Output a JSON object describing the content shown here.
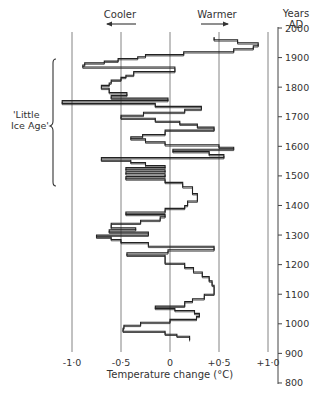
{
  "chart_data": {
    "type": "line",
    "style": "step",
    "title": "",
    "xlabel": "Temperature change (°C)",
    "ylabel": "Years AD",
    "xlim": [
      -1.0,
      1.0
    ],
    "ylim": [
      800,
      2000
    ],
    "x_ticks": [
      "-1·0",
      "-0·5",
      "0",
      "+0·5",
      "+1·0"
    ],
    "x_tick_values": [
      -1.0,
      -0.5,
      0,
      0.5,
      1.0
    ],
    "y_ticks": [
      "2000",
      "1900",
      "1800",
      "1700",
      "1600",
      "1500",
      "1400",
      "1300",
      "1200",
      "1100",
      "1000",
      "900",
      "800"
    ],
    "y_tick_values": [
      2000,
      1900,
      1800,
      1700,
      1600,
      1500,
      1400,
      1300,
      1200,
      1100,
      1000,
      900,
      800
    ],
    "grid": "vertical lines at each temperature tick",
    "annotations": {
      "cooler": "Cooler",
      "warmer": "Warmer",
      "little_ice_age": [
        "'Little",
        "Ice Age'"
      ],
      "little_ice_age_range": [
        1430,
        1870
      ]
    },
    "series": [
      {
        "name": "Temperature change",
        "steps": [
          {
            "from": 1970,
            "to": 1960,
            "value": 0.45
          },
          {
            "from": 1960,
            "to": 1950,
            "value": 0.69
          },
          {
            "from": 1950,
            "to": 1940,
            "value": 0.9
          },
          {
            "from": 1940,
            "to": 1930,
            "value": 0.85
          },
          {
            "from": 1930,
            "to": 1920,
            "value": 0.65
          },
          {
            "from": 1920,
            "to": 1910,
            "value": 0.14
          },
          {
            "from": 1910,
            "to": 1903,
            "value": -0.25
          },
          {
            "from": 1903,
            "to": 1897,
            "value": -0.33
          },
          {
            "from": 1897,
            "to": 1888,
            "value": -0.53
          },
          {
            "from": 1888,
            "to": 1882,
            "value": -0.67
          },
          {
            "from": 1882,
            "to": 1875,
            "value": -0.87
          },
          {
            "from": 1875,
            "to": 1868,
            "value": -0.89
          },
          {
            "from": 1868,
            "to": 1853,
            "value": 0.05
          },
          {
            "from": 1853,
            "to": 1840,
            "value": -0.37
          },
          {
            "from": 1840,
            "to": 1833,
            "value": -0.45
          },
          {
            "from": 1833,
            "to": 1824,
            "value": -0.5
          },
          {
            "from": 1824,
            "to": 1814,
            "value": -0.6
          },
          {
            "from": 1814,
            "to": 1806,
            "value": -0.62
          },
          {
            "from": 1806,
            "to": 1796,
            "value": -0.7
          },
          {
            "from": 1796,
            "to": 1782,
            "value": -0.62
          },
          {
            "from": 1782,
            "to": 1772,
            "value": -0.44
          },
          {
            "from": 1772,
            "to": 1763,
            "value": -0.6
          },
          {
            "from": 1763,
            "to": 1755,
            "value": -0.02
          },
          {
            "from": 1755,
            "to": 1745,
            "value": -1.1
          },
          {
            "from": 1745,
            "to": 1735,
            "value": -0.15
          },
          {
            "from": 1735,
            "to": 1725,
            "value": 0.32
          },
          {
            "from": 1725,
            "to": 1715,
            "value": 0.15
          },
          {
            "from": 1715,
            "to": 1705,
            "value": -0.27
          },
          {
            "from": 1705,
            "to": 1695,
            "value": -0.5
          },
          {
            "from": 1695,
            "to": 1685,
            "value": -0.15
          },
          {
            "from": 1685,
            "to": 1675,
            "value": 0.1
          },
          {
            "from": 1675,
            "to": 1665,
            "value": 0.28
          },
          {
            "from": 1665,
            "to": 1655,
            "value": 0.45
          },
          {
            "from": 1655,
            "to": 1640,
            "value": -0.05
          },
          {
            "from": 1640,
            "to": 1632,
            "value": -0.28
          },
          {
            "from": 1632,
            "to": 1625,
            "value": -0.4
          },
          {
            "from": 1625,
            "to": 1615,
            "value": -0.25
          },
          {
            "from": 1615,
            "to": 1605,
            "value": -0.05
          },
          {
            "from": 1605,
            "to": 1597,
            "value": 0.5
          },
          {
            "from": 1597,
            "to": 1590,
            "value": 0.65
          },
          {
            "from": 1590,
            "to": 1582,
            "value": 0.03
          },
          {
            "from": 1582,
            "to": 1572,
            "value": 0.4
          },
          {
            "from": 1572,
            "to": 1562,
            "value": 0.55
          },
          {
            "from": 1562,
            "to": 1553,
            "value": -0.7
          },
          {
            "from": 1553,
            "to": 1545,
            "value": -0.4
          },
          {
            "from": 1545,
            "to": 1535,
            "value": -0.25
          },
          {
            "from": 1535,
            "to": 1528,
            "value": -0.05
          },
          {
            "from": 1528,
            "to": 1521,
            "value": -0.45
          },
          {
            "from": 1521,
            "to": 1514,
            "value": -0.05
          },
          {
            "from": 1514,
            "to": 1507,
            "value": -0.45
          },
          {
            "from": 1507,
            "to": 1498,
            "value": -0.05
          },
          {
            "from": 1498,
            "to": 1490,
            "value": -0.45
          },
          {
            "from": 1490,
            "to": 1478,
            "value": -0.05
          },
          {
            "from": 1478,
            "to": 1463,
            "value": 0.13
          },
          {
            "from": 1463,
            "to": 1440,
            "value": 0.23
          },
          {
            "from": 1440,
            "to": 1415,
            "value": 0.28
          },
          {
            "from": 1415,
            "to": 1400,
            "value": 0.18
          },
          {
            "from": 1400,
            "to": 1390,
            "value": 0.15
          },
          {
            "from": 1390,
            "to": 1378,
            "value": -0.05
          },
          {
            "from": 1378,
            "to": 1370,
            "value": -0.45
          },
          {
            "from": 1370,
            "to": 1362,
            "value": -0.05
          },
          {
            "from": 1362,
            "to": 1350,
            "value": -0.1
          },
          {
            "from": 1350,
            "to": 1340,
            "value": -0.3
          },
          {
            "from": 1340,
            "to": 1325,
            "value": -0.6
          },
          {
            "from": 1325,
            "to": 1318,
            "value": -0.35
          },
          {
            "from": 1318,
            "to": 1310,
            "value": -0.62
          },
          {
            "from": 1310,
            "to": 1300,
            "value": -0.22
          },
          {
            "from": 1300,
            "to": 1293,
            "value": -0.75
          },
          {
            "from": 1293,
            "to": 1285,
            "value": -0.6
          },
          {
            "from": 1285,
            "to": 1275,
            "value": -0.5
          },
          {
            "from": 1275,
            "to": 1262,
            "value": -0.22
          },
          {
            "from": 1262,
            "to": 1250,
            "value": 0.45
          },
          {
            "from": 1250,
            "to": 1240,
            "value": -0.02
          },
          {
            "from": 1240,
            "to": 1232,
            "value": -0.44
          },
          {
            "from": 1232,
            "to": 1220,
            "value": -0.05
          },
          {
            "from": 1220,
            "to": 1205,
            "value": -0.05
          },
          {
            "from": 1205,
            "to": 1190,
            "value": 0.15
          },
          {
            "from": 1190,
            "to": 1175,
            "value": 0.24
          },
          {
            "from": 1175,
            "to": 1160,
            "value": 0.33
          },
          {
            "from": 1160,
            "to": 1145,
            "value": 0.4
          },
          {
            "from": 1145,
            "to": 1130,
            "value": 0.43
          },
          {
            "from": 1130,
            "to": 1100,
            "value": 0.45
          },
          {
            "from": 1100,
            "to": 1085,
            "value": 0.35
          },
          {
            "from": 1085,
            "to": 1075,
            "value": 0.23
          },
          {
            "from": 1075,
            "to": 1060,
            "value": 0.15
          },
          {
            "from": 1060,
            "to": 1052,
            "value": -0.15
          },
          {
            "from": 1052,
            "to": 1045,
            "value": 0.05
          },
          {
            "from": 1045,
            "to": 1035,
            "value": 0.25
          },
          {
            "from": 1035,
            "to": 1025,
            "value": 0.3
          },
          {
            "from": 1025,
            "to": 1015,
            "value": 0.27
          },
          {
            "from": 1015,
            "to": 1005,
            "value": 0.0
          },
          {
            "from": 1005,
            "to": 995,
            "value": -0.3
          },
          {
            "from": 995,
            "to": 985,
            "value": -0.47
          },
          {
            "from": 985,
            "to": 975,
            "value": -0.48
          },
          {
            "from": 975,
            "to": 965,
            "value": -0.05
          },
          {
            "from": 965,
            "to": 958,
            "value": 0.07
          },
          {
            "from": 958,
            "to": 950,
            "value": 0.2
          },
          {
            "from": 950,
            "to": 945,
            "value": 0.2
          }
        ]
      }
    ]
  }
}
